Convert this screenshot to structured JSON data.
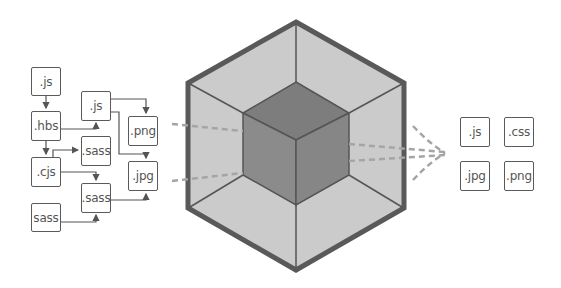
{
  "diagram": {
    "input_modules": [
      {
        "id": "m1",
        "label": ".js",
        "x": 31,
        "y": 67,
        "w": 30,
        "h": 29
      },
      {
        "id": "m2",
        "label": ".hbs",
        "x": 31,
        "y": 111,
        "w": 30,
        "h": 30
      },
      {
        "id": "m3",
        "label": ".cjs",
        "x": 31,
        "y": 157,
        "w": 30,
        "h": 30
      },
      {
        "id": "m4",
        "label": "sass",
        "x": 31,
        "y": 203,
        "w": 30,
        "h": 29
      },
      {
        "id": "m5",
        "label": ".js",
        "x": 81,
        "y": 91,
        "w": 30,
        "h": 30
      },
      {
        "id": "m6",
        "label": ".sass",
        "x": 81,
        "y": 136,
        "w": 30,
        "h": 30
      },
      {
        "id": "m7",
        "label": ".sass",
        "x": 81,
        "y": 183,
        "w": 30,
        "h": 30
      },
      {
        "id": "m8",
        "label": ".png",
        "x": 128,
        "y": 116,
        "w": 30,
        "h": 30
      },
      {
        "id": "m9",
        "label": ".jpg",
        "x": 128,
        "y": 161,
        "w": 30,
        "h": 30
      }
    ],
    "bundler_icon": "hexagon-cube-icon",
    "output_assets": [
      {
        "id": "o1",
        "label": ".js",
        "x": 460,
        "y": 117,
        "w": 30,
        "h": 30
      },
      {
        "id": "o2",
        "label": ".css",
        "x": 504,
        "y": 117,
        "w": 30,
        "h": 30
      },
      {
        "id": "o3",
        "label": ".jpg",
        "x": 460,
        "y": 161,
        "w": 30,
        "h": 30
      },
      {
        "id": "o4",
        "label": ".png",
        "x": 504,
        "y": 161,
        "w": 30,
        "h": 30
      }
    ],
    "colors": {
      "box_border": "#5a5a5a",
      "text": "#555555",
      "hex_outline": "#595959",
      "hex_face": "#c8c8c8",
      "cube_top": "#7e7e7e",
      "cube_left": "#8a8a8a",
      "cube_right": "#858585",
      "dash": "#a0a0a0"
    }
  }
}
